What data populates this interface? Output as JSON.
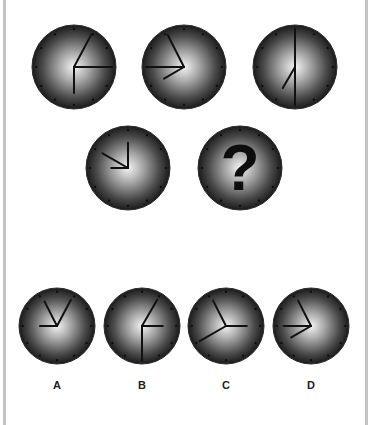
{
  "puzzle": {
    "sequence": [
      {
        "id": "clock-1",
        "cx": 74,
        "cy": 67,
        "r": 42,
        "hands": [
          {
            "angle": 28,
            "len": 0.88
          },
          {
            "angle": 90,
            "len": 0.88
          },
          {
            "angle": 180,
            "len": 0.62
          }
        ]
      },
      {
        "id": "clock-2",
        "cx": 184,
        "cy": 67,
        "r": 42,
        "hands": [
          {
            "angle": 333,
            "len": 0.86
          },
          {
            "angle": 270,
            "len": 0.88
          },
          {
            "angle": 240,
            "len": 0.55
          }
        ]
      },
      {
        "id": "clock-3",
        "cx": 295,
        "cy": 67,
        "r": 42,
        "hands": [
          {
            "angle": 0,
            "len": 0.92
          },
          {
            "angle": 180,
            "len": 0.92
          },
          {
            "angle": 210,
            "len": 0.58
          }
        ]
      },
      {
        "id": "clock-4",
        "cx": 128,
        "cy": 168,
        "r": 42,
        "hands": [
          {
            "angle": 0,
            "len": 0.6
          },
          {
            "angle": 300,
            "len": 0.7
          },
          {
            "angle": 270,
            "len": 0.4
          }
        ]
      }
    ],
    "unknown": {
      "id": "clock-unknown",
      "cx": 240,
      "cy": 168,
      "r": 42,
      "symbol": "?"
    },
    "options": [
      {
        "label": "A",
        "cx": 57,
        "cy": 326,
        "r": 38,
        "hands": [
          {
            "angle": 333,
            "len": 0.72
          },
          {
            "angle": 28,
            "len": 0.78
          },
          {
            "angle": 270,
            "len": 0.45
          }
        ]
      },
      {
        "label": "B",
        "cx": 142,
        "cy": 326,
        "r": 38,
        "hands": [
          {
            "angle": 30,
            "len": 0.8
          },
          {
            "angle": 90,
            "len": 0.55
          },
          {
            "angle": 180,
            "len": 0.88
          }
        ]
      },
      {
        "label": "C",
        "cx": 226,
        "cy": 326,
        "r": 38,
        "hands": [
          {
            "angle": 333,
            "len": 0.75
          },
          {
            "angle": 90,
            "len": 0.55
          },
          {
            "angle": 240,
            "len": 0.8
          }
        ]
      },
      {
        "label": "D",
        "cx": 311,
        "cy": 326,
        "r": 38,
        "hands": [
          {
            "angle": 333,
            "len": 0.75
          },
          {
            "angle": 270,
            "len": 0.72
          },
          {
            "angle": 240,
            "len": 0.6
          }
        ]
      }
    ],
    "option_label_y": 386
  },
  "colors": {
    "face_center": "#f2f2f2",
    "face_mid": "#8a8a8a",
    "face_edge": "#1e1e1e",
    "hand": "#111111",
    "tick": "#0a0a0a",
    "frame": "#c4c4c4"
  }
}
